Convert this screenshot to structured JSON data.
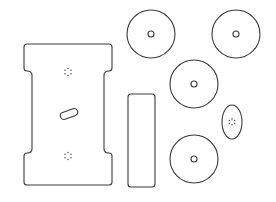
{
  "diagram": {
    "type": "cut-pattern",
    "background": "#ffffff",
    "stroke_color": "#3a3a3a",
    "parts": {
      "main_plate": {
        "label": "notched plate",
        "outer": {
          "x_left": 24,
          "x_right": 112,
          "y_top": 44,
          "y_bottom": 185,
          "neck_left": 32,
          "neck_right": 104,
          "notch_top_y": 72,
          "notch_bottom_y": 152
        },
        "bolt_pattern_top": {
          "cx": 68,
          "cy": 72,
          "r": 3.5,
          "holes": 6
        },
        "bolt_pattern_bottom": {
          "cx": 68,
          "cy": 156,
          "r": 3.5,
          "holes": 6
        },
        "slot": {
          "cx": 69,
          "cy": 114,
          "length": 18,
          "width": 7,
          "angle": -20
        }
      },
      "bar": {
        "label": "rectangular bar",
        "x": 128,
        "y": 94,
        "w": 27,
        "h": 93,
        "rx": 3
      },
      "discs": [
        {
          "label": "disc 1",
          "cx": 151,
          "cy": 34,
          "r": 24,
          "hole_r": 3
        },
        {
          "label": "disc 2",
          "cx": 236,
          "cy": 34,
          "r": 24,
          "hole_r": 3
        },
        {
          "label": "disc 3",
          "cx": 194,
          "cy": 84,
          "r": 24,
          "hole_r": 3
        },
        {
          "label": "disc 4",
          "cx": 194,
          "cy": 159,
          "r": 24,
          "hole_r": 3
        }
      ],
      "ellipse": {
        "label": "oval plate",
        "cx": 232,
        "cy": 122,
        "rx": 10,
        "ry": 17,
        "bolt_pattern": {
          "r": 3,
          "holes": 6
        }
      }
    }
  }
}
